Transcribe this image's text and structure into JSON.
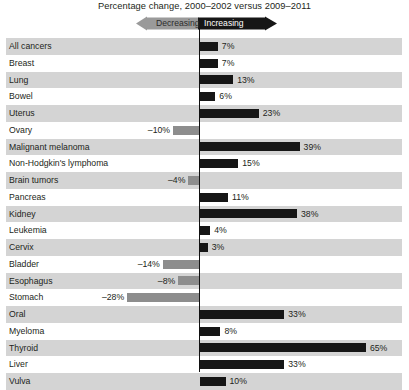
{
  "title": "Percentage change, 2000–2002 versus 2009–2011",
  "banner": {
    "decreasing_label": "Decreasing",
    "increasing_label": "Increasing",
    "decreasing_color": "#9a9a9a",
    "increasing_color": "#161616"
  },
  "colors": {
    "positive_bar": "#161616",
    "negative_bar": "#8d8d8d",
    "row_shaded": "#d4d4d4",
    "row_plain": "#ffffff",
    "axis": "#111111",
    "text": "#231f20"
  },
  "chart_data": {
    "type": "bar",
    "orientation": "horizontal",
    "title": "Percentage change, 2000–2002 versus 2009–2011",
    "xlabel": "",
    "ylabel": "",
    "grid": false,
    "legend": "none",
    "xlim": [
      -30,
      70
    ],
    "zero_line": true,
    "value_suffix": "%",
    "categories": [
      "All cancers",
      "Breast",
      "Lung",
      "Bowel",
      "Uterus",
      "Ovary",
      "Malignant melanoma",
      "Non-Hodgkin's lymphoma",
      "Brain tumors",
      "Pancreas",
      "Kidney",
      "Leukemia",
      "Cervix",
      "Bladder",
      "Esophagus",
      "Stomach",
      "Oral",
      "Myeloma",
      "Thyroid",
      "Liver",
      "Vulva"
    ],
    "values": [
      7,
      7,
      13,
      6,
      23,
      -10,
      39,
      15,
      -4,
      11,
      38,
      4,
      3,
      -14,
      -8,
      -28,
      33,
      8,
      65,
      33,
      10
    ],
    "value_labels": [
      "7%",
      "7%",
      "13%",
      "6%",
      "23%",
      "–10%",
      "39%",
      "15%",
      "–4%",
      "11%",
      "38%",
      "4%",
      "3%",
      "–14%",
      "–8%",
      "–28%",
      "33%",
      "8%",
      "65%",
      "33%",
      "10%"
    ]
  }
}
